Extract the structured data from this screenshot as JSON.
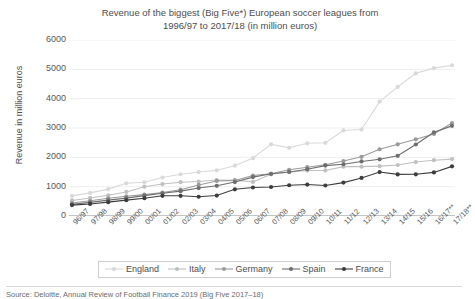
{
  "chart_data": {
    "type": "line",
    "title": "Revenue of the biggest (Big Five*) European soccer leagues from 1996/97 to 2017/18 (in million euros)",
    "title_line1": "Revenue of the biggest (Big Five*) European soccer leagues from",
    "title_line2": "1996/97 to 2017/18 (in million euros)",
    "xlabel": "",
    "ylabel": "Revenue in million euros",
    "ylim": [
      0,
      6000
    ],
    "ytick_values": [
      0,
      1000,
      2000,
      3000,
      4000,
      5000,
      6000
    ],
    "ytick_labels": [
      "0",
      "1000",
      "2000",
      "3000",
      "4000",
      "5000",
      "6000"
    ],
    "grid": true,
    "legend_position": "bottom",
    "categories": [
      "96/97",
      "97/98",
      "98/99",
      "99/00",
      "00/01",
      "01/02",
      "02/03",
      "03/04",
      "04/05",
      "05/06",
      "06/07",
      "07/08",
      "08/09",
      "09/10",
      "10/11",
      "11/12",
      "12/13",
      "13/14",
      "14/15",
      "15/16",
      "16/17**",
      "17/18**"
    ],
    "series": [
      {
        "name": "England",
        "color": "#d9d9d9",
        "values": [
          686,
          788,
          916,
          1115,
          1151,
          1313,
          1423,
          1498,
          1558,
          1715,
          1973,
          2441,
          2326,
          2479,
          2496,
          2917,
          2946,
          3898,
          4400,
          4865,
          5040,
          5140
        ]
      },
      {
        "name": "Italy",
        "color": "#c0c0c0",
        "values": [
          531,
          616,
          707,
          821,
          999,
          1089,
          1152,
          1175,
          1226,
          1220,
          1163,
          1421,
          1494,
          1549,
          1553,
          1682,
          1682,
          1699,
          1738,
          1840,
          1902,
          1940
        ]
      },
      {
        "name": "Germany",
        "color": "#9b9b9b",
        "values": [
          444,
          520,
          606,
          671,
          728,
          801,
          897,
          1058,
          1195,
          1213,
          1379,
          1438,
          1575,
          1664,
          1746,
          1875,
          2018,
          2275,
          2444,
          2615,
          2795,
          3170
        ]
      },
      {
        "name": "Spain",
        "color": "#6e6e6e",
        "values": [
          397,
          465,
          542,
          610,
          696,
          776,
          847,
          953,
          1029,
          1158,
          1326,
          1438,
          1501,
          1595,
          1718,
          1765,
          1859,
          1933,
          2053,
          2437,
          2854,
          3073
        ]
      },
      {
        "name": "France",
        "color": "#3d3d3d",
        "values": [
          372,
          410,
          473,
          540,
          607,
          689,
          689,
          656,
          698,
          910,
          972,
          989,
          1048,
          1072,
          1040,
          1138,
          1297,
          1498,
          1418,
          1422,
          1486,
          1692
        ]
      }
    ]
  },
  "footnote": "Source: Deloitte, Annual Review of Football Finance 2019 (Big Five 2017–18)"
}
